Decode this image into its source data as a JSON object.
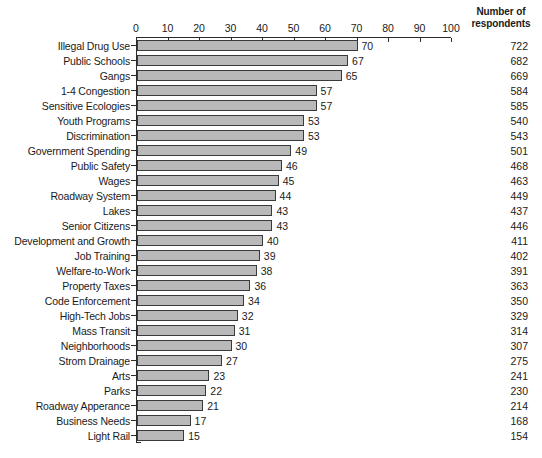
{
  "chart_data": {
    "type": "bar",
    "orientation": "horizontal",
    "title": "",
    "xlabel": "",
    "ylabel": "",
    "xlim": [
      0,
      100
    ],
    "xticks": [
      0,
      10,
      20,
      30,
      40,
      50,
      60,
      70,
      80,
      90,
      100
    ],
    "grid": false,
    "legend": null,
    "bar_color": "#b9b9b9",
    "bar_edge_color": "#3a3a3a",
    "secondary_column_header": [
      "Number of",
      "respondents"
    ],
    "categories": [
      "Illegal Drug Use",
      "Public Schools",
      "Gangs",
      "1-4 Congestion",
      "Sensitive Ecologies",
      "Youth Programs",
      "Discrimination",
      "Government Spending",
      "Public Safety",
      "Wages",
      "Roadway System",
      "Lakes",
      "Senior Citizens",
      "Development and Growth",
      "Job Training",
      "Welfare-to-Work",
      "Property Taxes",
      "Code Enforcement",
      "High-Tech Jobs",
      "Mass Transit",
      "Neighborhoods",
      "Strom Drainage",
      "Arts",
      "Parks",
      "Roadway Apperance",
      "Business Needs",
      "Light Rail"
    ],
    "values": [
      70,
      67,
      65,
      57,
      57,
      53,
      53,
      49,
      46,
      45,
      44,
      43,
      43,
      40,
      39,
      38,
      36,
      34,
      32,
      31,
      30,
      27,
      23,
      22,
      21,
      17,
      15
    ],
    "respondents": [
      722,
      682,
      669,
      584,
      585,
      540,
      543,
      501,
      468,
      463,
      449,
      437,
      446,
      411,
      402,
      391,
      363,
      350,
      329,
      314,
      307,
      275,
      241,
      230,
      214,
      168,
      154
    ]
  }
}
